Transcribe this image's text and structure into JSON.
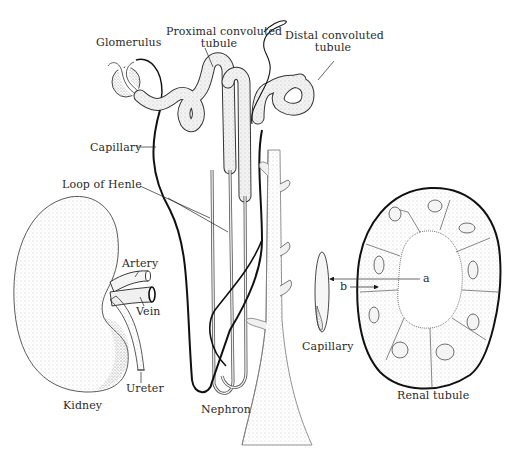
{
  "diagram": {
    "style": "black-and-white stippled scientific illustration",
    "colors": {
      "background": "#ffffff",
      "ink": "#1a1a1a",
      "label": "#2a2a2a",
      "stipple": "#8a8a8a"
    },
    "panels": [
      {
        "id": "kidney",
        "caption": "Kidney"
      },
      {
        "id": "nephron",
        "caption": "Nephron"
      },
      {
        "id": "renal-tubule",
        "caption": "Renal tubule"
      }
    ],
    "labels": {
      "glomerulus": "Glomerulus",
      "proximal_line1": "Proximal convoluted",
      "proximal_line2": "tubule",
      "distal_line1": "Distal convoluted",
      "distal_line2": "tubule",
      "capillary_top": "Capillary",
      "loop_of_henle": "Loop of Henle",
      "artery": "Artery",
      "vein": "Vein",
      "ureter": "Ureter",
      "kidney": "Kidney",
      "nephron": "Nephron",
      "capillary_cross": "Capillary",
      "renal_tubule": "Renal tubule",
      "arrow_a": "a",
      "arrow_b": "b"
    }
  }
}
